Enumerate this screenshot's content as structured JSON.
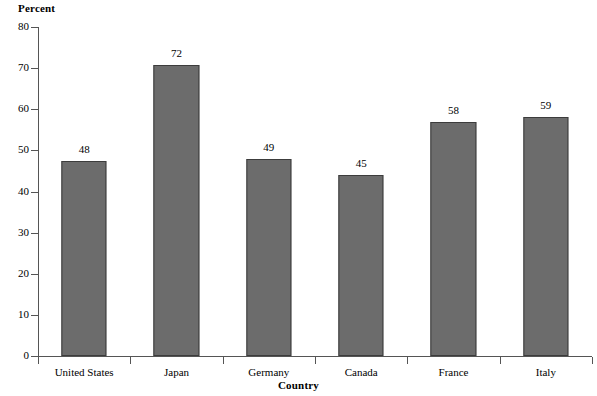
{
  "chart_data": {
    "type": "bar",
    "title": "",
    "xlabel": "Country",
    "ylabel": "Percent",
    "categories": [
      "United States",
      "Japan",
      "Germany",
      "Canada",
      "France",
      "Italy"
    ],
    "values": [
      48,
      72,
      49,
      45,
      58,
      59
    ],
    "bar_tops": [
      47.5,
      70.8,
      48.0,
      44.0,
      57.0,
      58.0
    ],
    "data_labels": [
      "48",
      "72",
      "49",
      "45",
      "58",
      "59"
    ],
    "ylim": [
      0,
      80
    ],
    "ytick_labels": [
      "0",
      "10",
      "20",
      "30",
      "40",
      "50",
      "60",
      "70",
      "80"
    ],
    "ytick_values": [
      0,
      10,
      20,
      30,
      40,
      50,
      60,
      70,
      80
    ],
    "grid": false,
    "legend": false,
    "legend_position": "none",
    "bar_color": "#6c6c6c",
    "bar_edge_color": "#3c3c3c",
    "axis_color": "#555555",
    "background_color": "#ffffff"
  }
}
